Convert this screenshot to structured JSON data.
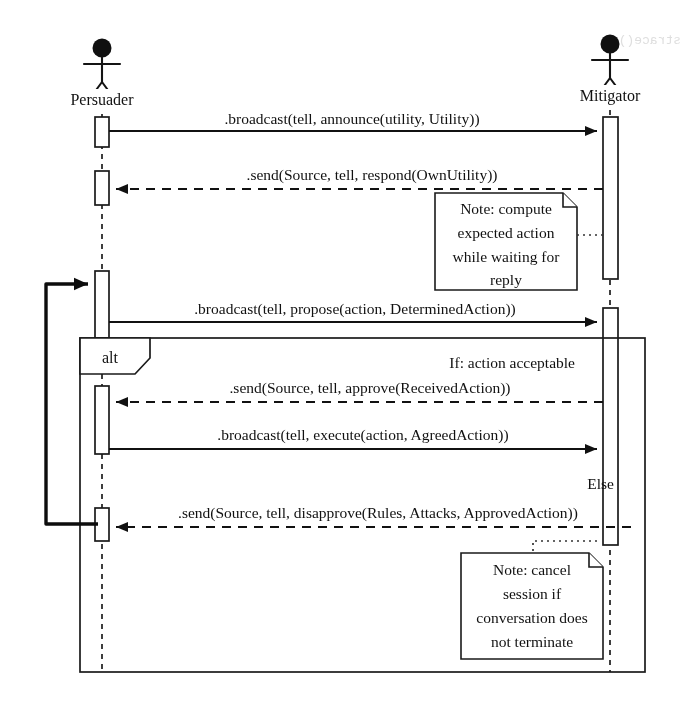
{
  "diagram": {
    "type": "uml-sequence-diagram",
    "title": "",
    "background_color": "#ffffff",
    "line_color": "#1a1a1a"
  },
  "lifelines": [
    {
      "id": "persuader",
      "name": "Persuader",
      "x": 102
    },
    {
      "id": "mitigator",
      "name": "Mitigator",
      "x": 610
    }
  ],
  "messages": [
    {
      "index": 1,
      "label": ".broadcast(tell, announce(utility, Utility))",
      "from": "persuader",
      "to": "mitigator",
      "kind": "synchronous",
      "y": 130
    },
    {
      "index": 2,
      "label": ".send(Source, tell, respond(OwnUtility))",
      "from": "mitigator",
      "to": "persuader",
      "kind": "return",
      "y": 186
    },
    {
      "index": 3,
      "label": ".broadcast(tell, propose(action, DeterminedAction))",
      "from": "persuader",
      "to": "mitigator",
      "kind": "synchronous",
      "y": 320
    },
    {
      "index": 4,
      "label": ".send(Source, tell, approve(ReceivedAction))",
      "from": "mitigator",
      "to": "persuader",
      "kind": "return",
      "y": 399
    },
    {
      "index": 5,
      "label": ".broadcast(tell, execute(action, AgreedAction))",
      "from": "persuader",
      "to": "mitigator",
      "kind": "synchronous",
      "y": 446
    },
    {
      "index": 6,
      "label": ".send(Source, tell, disapprove(Rules, Attacks, ApprovedAction))",
      "from": "mitigator",
      "to": "persuader",
      "kind": "return",
      "y": 523
    }
  ],
  "fragment": {
    "operator": "alt",
    "guards": [
      {
        "id": "if",
        "label": "If: action acceptable"
      },
      {
        "id": "else",
        "label": "Else"
      }
    ]
  },
  "notes": [
    {
      "id": "note-compute",
      "lines": [
        "Note: compute",
        "expected action",
        "while waiting for",
        "reply"
      ],
      "attached_to": "mitigator"
    },
    {
      "id": "note-cancel",
      "lines": [
        "Note: cancel",
        "session if",
        "conversation does",
        "not terminate"
      ],
      "attached_to": "mitigator"
    }
  ],
  "loop": {
    "id": "loopback-arrow",
    "description": "return flow from disapprove back to propose activation"
  }
}
